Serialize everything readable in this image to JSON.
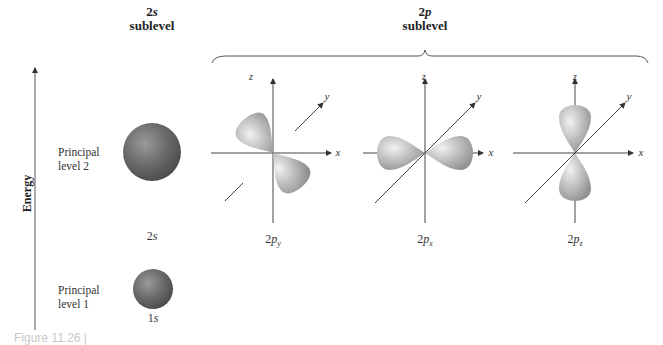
{
  "figure": {
    "headers": {
      "s_sublevel": {
        "prefix": "2",
        "letter": "s",
        "word": "sublevel"
      },
      "p_sublevel": {
        "prefix": "2",
        "letter": "p",
        "word": "sublevel"
      }
    },
    "energy_axis": {
      "label": "Energy"
    },
    "principal_levels": [
      {
        "label_line1": "Principal",
        "label_line2": "level 2"
      },
      {
        "label_line1": "Principal",
        "label_line2": "level 1"
      }
    ],
    "orbitals": {
      "s2": {
        "number": "2",
        "letter": "s"
      },
      "s1": {
        "number": "1",
        "letter": "s"
      },
      "py": {
        "number": "2",
        "letter": "p",
        "sub": "y"
      },
      "px": {
        "number": "2",
        "letter": "p",
        "sub": "x"
      },
      "pz": {
        "number": "2",
        "letter": "p",
        "sub": "z"
      }
    },
    "axis_labels": {
      "x": "x",
      "y": "y",
      "z": "z"
    },
    "caption": "Figure 11.26 |",
    "colors": {
      "sphere": "#6e6e6e",
      "lobe": "#b8b8b8",
      "axis": "#444444",
      "text": "#222222"
    }
  }
}
